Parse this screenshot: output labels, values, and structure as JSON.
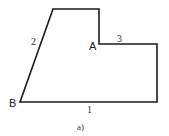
{
  "figure": {
    "caption": "a)",
    "stroke_color": "#1a1a1a",
    "shape": {
      "type": "polygon",
      "vertices": [
        [
          20,
          102
        ],
        [
          53,
          9
        ],
        [
          99,
          9
        ],
        [
          99,
          44
        ],
        [
          157,
          44
        ],
        [
          157,
          102
        ]
      ]
    },
    "points": [
      {
        "name": "A",
        "x": 99,
        "y": 44
      },
      {
        "name": "B",
        "x": 20,
        "y": 102
      }
    ],
    "edge_labels": [
      {
        "id": "1",
        "text": "1",
        "edge": "bottom"
      },
      {
        "id": "2",
        "text": "2",
        "edge": "slanted-left"
      },
      {
        "id": "3",
        "text": "3",
        "edge": "middle-horizontal"
      }
    ]
  }
}
